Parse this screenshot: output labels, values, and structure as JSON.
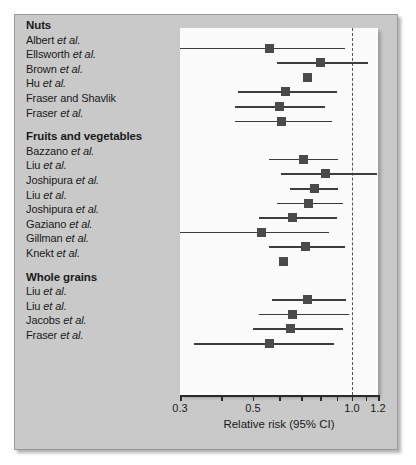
{
  "figure": {
    "background": "#ffffff",
    "panel_color": "#c9c9c9",
    "plot_background": "#fbfbfb",
    "marker_color": "#4a4a4a",
    "line_color": "#3d3d3d"
  },
  "axis": {
    "xlabel": "Relative risk (95% CI)",
    "scale": "log",
    "xmin": 0.3,
    "xmax": 1.2,
    "null_value": 1.0,
    "ticks": [
      0.3,
      0.4,
      0.5,
      0.6,
      0.7,
      0.8,
      0.9,
      1.0,
      1.1,
      1.2
    ],
    "tick_labels": [
      "0.3",
      "",
      "0.5",
      "",
      "",
      "",
      "",
      "1.0",
      "",
      "1.2"
    ]
  },
  "chart_data": {
    "type": "forest",
    "title": "",
    "xlabel": "Relative risk (95% CI)",
    "ylabel": "",
    "xlim": [
      0.3,
      1.2
    ],
    "xscale": "log",
    "null_line": 1.0,
    "grid": false,
    "legend": "none",
    "groups": [
      {
        "name": "Nuts",
        "studies": [
          {
            "label": "Albert et al.",
            "rr": 0.56,
            "ci_low": 0.3,
            "ci_high": 0.95
          },
          {
            "label": "Ellsworth et al.",
            "rr": 0.8,
            "ci_low": 0.59,
            "ci_high": 1.12
          },
          {
            "label": "Brown et al.",
            "rr": 0.73,
            "ci_low": 0.73,
            "ci_high": 0.73
          },
          {
            "label": "Hu et al.",
            "rr": 0.63,
            "ci_low": 0.45,
            "ci_high": 0.9
          },
          {
            "label": "Fraser and Shavlik",
            "rr": 0.6,
            "ci_low": 0.44,
            "ci_high": 0.83
          },
          {
            "label": "Fraser et al.",
            "rr": 0.61,
            "ci_low": 0.44,
            "ci_high": 0.87
          }
        ]
      },
      {
        "name": "Fruits and vegetables",
        "studies": [
          {
            "label": "Bazzano et al.",
            "rr": 0.71,
            "ci_low": 0.56,
            "ci_high": 0.91
          },
          {
            "label": "Liu et al.",
            "rr": 0.83,
            "ci_low": 0.61,
            "ci_high": 1.19
          },
          {
            "label": "Joshipura et al.",
            "rr": 0.77,
            "ci_low": 0.65,
            "ci_high": 0.91
          },
          {
            "label": "Liu et al.",
            "rr": 0.74,
            "ci_low": 0.59,
            "ci_high": 0.94
          },
          {
            "label": "Joshipura et al.",
            "rr": 0.66,
            "ci_low": 0.52,
            "ci_high": 0.9
          },
          {
            "label": "Gaziano et al.",
            "rr": 0.53,
            "ci_low": 0.3,
            "ci_high": 0.85
          },
          {
            "label": "Gillman et al.",
            "rr": 0.72,
            "ci_low": 0.56,
            "ci_high": 0.95
          },
          {
            "label": "Knekt et al.",
            "rr": 0.62,
            "ci_low": 0.62,
            "ci_high": 0.62
          }
        ]
      },
      {
        "name": "Whole grains",
        "studies": [
          {
            "label": "Liu et al.",
            "rr": 0.73,
            "ci_low": 0.57,
            "ci_high": 0.96
          },
          {
            "label": "Liu et al.",
            "rr": 0.66,
            "ci_low": 0.52,
            "ci_high": 0.98
          },
          {
            "label": "Jacobs et al.",
            "rr": 0.65,
            "ci_low": 0.5,
            "ci_high": 0.94
          },
          {
            "label": "Fraser et al.",
            "rr": 0.56,
            "ci_low": 0.33,
            "ci_high": 0.88
          }
        ]
      }
    ]
  }
}
